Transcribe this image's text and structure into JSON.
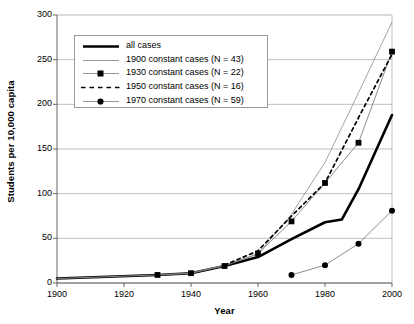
{
  "chart_data": {
    "type": "line",
    "title": "",
    "xlabel": "Year",
    "ylabel": "Students per 10,000 capita",
    "xlim": [
      1900,
      2000
    ],
    "ylim": [
      0,
      300
    ],
    "xticks": [
      1900,
      1920,
      1940,
      1960,
      1980,
      2000
    ],
    "yticks": [
      0,
      50,
      100,
      150,
      200,
      250,
      300
    ],
    "grid": "horizontal",
    "legend_position": "upper-left-inside",
    "series": [
      {
        "name": "all cases",
        "style": "thick-solid-black",
        "color": "#000000",
        "marker": "none",
        "x": [
          1900,
          1930,
          1940,
          1950,
          1960,
          1970,
          1980,
          1985,
          1990,
          2000
        ],
        "values": [
          5,
          9,
          11,
          19,
          29,
          49,
          68,
          71,
          105,
          188
        ]
      },
      {
        "name": "1900 constant cases (N = 43)",
        "style": "thin-solid-gray",
        "color": "#999999",
        "marker": "none",
        "x": [
          1900,
          1930,
          1940,
          1950,
          1960,
          1970,
          1980,
          1990,
          2000
        ],
        "values": [
          5,
          9,
          11,
          20,
          32,
          77,
          135,
          213,
          292
        ]
      },
      {
        "name": "1930 constant cases (N = 22)",
        "style": "thin-solid-gray-square-markers",
        "color": "#808080",
        "marker": "square",
        "x": [
          1930,
          1940,
          1950,
          1960,
          1970,
          1980,
          1990,
          2000
        ],
        "values": [
          9,
          11,
          19,
          33,
          69,
          112,
          157,
          259
        ]
      },
      {
        "name": "1950 constant cases (N = 16)",
        "style": "dashed-black",
        "color": "#000000",
        "marker": "none",
        "x": [
          1950,
          1960,
          1970,
          1980,
          1990,
          2000
        ],
        "values": [
          20,
          36,
          75,
          112,
          185,
          256
        ]
      },
      {
        "name": "1970 constant cases (N = 59)",
        "style": "thin-solid-gray-circle-markers",
        "color": "#808080",
        "marker": "circle",
        "x": [
          1970,
          1980,
          1990,
          2000
        ],
        "values": [
          9,
          20,
          44,
          81
        ]
      }
    ]
  },
  "axes": {
    "x_title": "Year",
    "y_title": "Students per 10,000 capita",
    "x_tick_labels": [
      "1900",
      "1920",
      "1940",
      "1960",
      "1980",
      "2000"
    ],
    "y_tick_labels": [
      "0",
      "50",
      "100",
      "150",
      "200",
      "250",
      "300"
    ]
  },
  "legend": {
    "entries": [
      {
        "label": "all cases"
      },
      {
        "label": "1900 constant cases (N = 43)"
      },
      {
        "label": "1930 constant cases (N = 22)"
      },
      {
        "label": "1950 constant cases (N = 16)"
      },
      {
        "label": "1970 constant cases (N = 59)"
      }
    ]
  },
  "colors": {
    "series_black": "#000000",
    "series_gray": "#8c8c8c",
    "gridline": "#b0b0b0",
    "axis": "#555555",
    "background": "#ffffff"
  }
}
